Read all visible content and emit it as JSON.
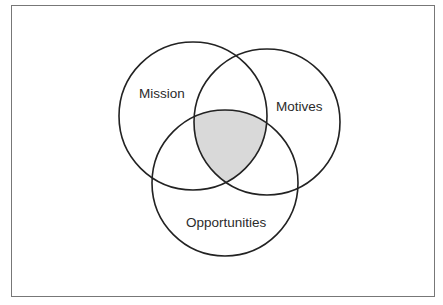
{
  "diagram": {
    "type": "venn",
    "sets": [
      {
        "id": "mission",
        "label": "Mission",
        "cx": 193,
        "cy": 116,
        "r": 74
      },
      {
        "id": "motives",
        "label": "Motives",
        "cx": 267,
        "cy": 122,
        "r": 73
      },
      {
        "id": "opportunities",
        "label": "Opportunities",
        "cx": 225,
        "cy": 183,
        "r": 73
      }
    ],
    "highlighted_region": {
      "description": "intersection of Mission, Motives and Opportunities",
      "fill": "#d9d9d9"
    },
    "colors": {
      "stroke": "#222222",
      "text": "#2b2b2b",
      "frame_border": "#777777",
      "background": "#ffffff"
    }
  }
}
